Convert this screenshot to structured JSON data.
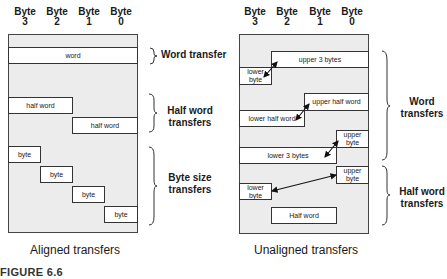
{
  "figure_label": "FIGURE 6.6",
  "columns": [
    {
      "line1": "Byte",
      "line2": "3"
    },
    {
      "line1": "Byte",
      "line2": "2"
    },
    {
      "line1": "Byte",
      "line2": "1"
    },
    {
      "line1": "Byte",
      "line2": "0"
    }
  ],
  "aligned": {
    "caption": "Aligned transfers",
    "cells": {
      "word": "word",
      "half1": "half word",
      "half2": "half word",
      "byte1": "byte",
      "byte2": "byte",
      "byte3": "byte",
      "byte4": "byte"
    },
    "groups": {
      "word": "Word transfer",
      "half": "Half word transfers",
      "byte": "Byte size transfers"
    }
  },
  "unaligned": {
    "caption": "Unaligned transfers",
    "cells": {
      "upper3": "upper 3 bytes",
      "lowerbyte1": "lower byte",
      "upperhalf": "upper half word",
      "lowerhalf": "lower half word",
      "upperbyte1": "upper byte",
      "lower3": "lower 3 bytes",
      "upperbyte2": "upper byte",
      "lowerbyte2": "lower byte",
      "halfword": "Half word"
    },
    "groups": {
      "word": "Word transfers",
      "half": "Half word transfers"
    }
  }
}
